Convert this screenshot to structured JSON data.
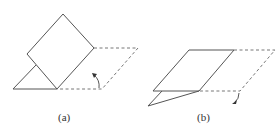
{
  "figure": {
    "panels": [
      {
        "id": "a",
        "label": "(a)",
        "description": "Square folded upward along a diagonal crease; small triangle below, dashed parallelogram outline showing original position, curved arrow indicating upward folding",
        "label_pos": [
          58,
          112
        ]
      },
      {
        "id": "b",
        "label": "(b)",
        "description": "Parallelogram lying nearly flat with thin lower triangular flap; dashed outline of original position; curved arrow indicating downward folding",
        "label_pos": [
          197,
          112
        ]
      }
    ],
    "colors": {
      "line": "#555555",
      "dashed": "#777777",
      "text": "#333333"
    }
  }
}
